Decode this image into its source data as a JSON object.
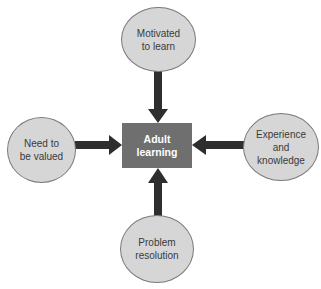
{
  "diagram": {
    "center": {
      "label": "Adult\nlearning",
      "color": "#6f6f6f"
    },
    "nodes": [
      {
        "id": "top",
        "label": "Motivated\nto learn",
        "position": "top",
        "arrow_direction": "down"
      },
      {
        "id": "left",
        "label": "Need to\nbe valued",
        "position": "left",
        "arrow_direction": "right"
      },
      {
        "id": "right",
        "label": "Experience\nand\nknowledge",
        "position": "right",
        "arrow_direction": "left"
      },
      {
        "id": "bottom",
        "label": "Problem\nresolution",
        "position": "bottom",
        "arrow_direction": "up"
      }
    ],
    "colors": {
      "node_fill": "#d6d6d6",
      "node_border": "#7a7a7a",
      "arrow": "#2e2e2e"
    }
  }
}
